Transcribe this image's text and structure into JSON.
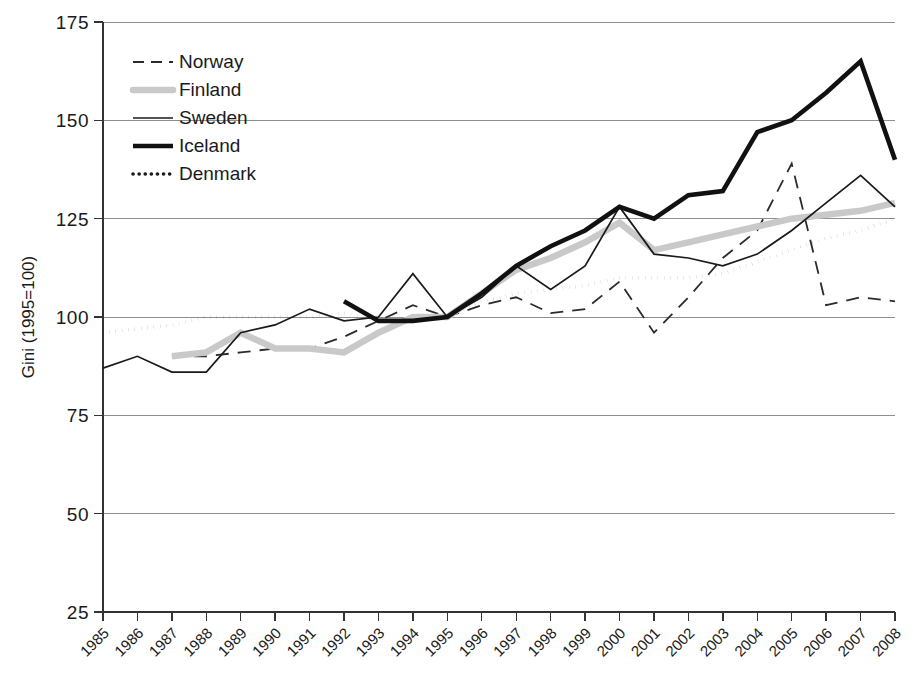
{
  "chart_data": {
    "type": "line",
    "title": "",
    "xlabel": "",
    "ylabel": "Gini (1995=100)",
    "ylim": [
      25,
      175
    ],
    "yticks": [
      25,
      50,
      75,
      100,
      125,
      150,
      175
    ],
    "grid": true,
    "legend_position": "top-left",
    "x": [
      1985,
      1986,
      1987,
      1988,
      1989,
      1990,
      1991,
      1992,
      1993,
      1994,
      1995,
      1996,
      1997,
      1998,
      1999,
      2000,
      2001,
      2002,
      2003,
      2004,
      2005,
      2006,
      2007,
      2008
    ],
    "categories": [
      "1985",
      "1986",
      "1987",
      "1988",
      "1989",
      "1990",
      "1991",
      "1992",
      "1993",
      "1994",
      "1995",
      "1996",
      "1997",
      "1998",
      "1999",
      "2000",
      "2001",
      "2002",
      "2003",
      "2004",
      "2005",
      "2006",
      "2007",
      "2008"
    ],
    "series": [
      {
        "name": "Norway",
        "style": "dashed",
        "color": "#2b2b2b",
        "width": 1.8,
        "values": [
          null,
          null,
          90,
          90,
          91,
          92,
          92,
          95,
          99,
          103,
          100,
          103,
          105,
          101,
          102,
          109,
          96,
          105,
          115,
          122,
          139,
          103,
          105,
          104
        ]
      },
      {
        "name": "Finland",
        "style": "thick-light",
        "color": "#c9c9c9",
        "width": 6.5,
        "values": [
          null,
          null,
          90,
          91,
          96,
          92,
          92,
          91,
          96,
          100,
          100,
          106,
          112,
          115,
          119,
          124,
          117,
          119,
          121,
          123,
          125,
          126,
          127,
          129
        ]
      },
      {
        "name": "Sweden",
        "style": "solid-thin",
        "color": "#1a1a1a",
        "width": 1.7,
        "values": [
          87,
          90,
          86,
          86,
          96,
          98,
          102,
          99,
          100,
          111,
          100,
          105,
          113,
          107,
          113,
          128,
          116,
          115,
          113,
          116,
          122,
          129,
          136,
          128
        ]
      },
      {
        "name": "Iceland",
        "style": "solid-thick",
        "color": "#111111",
        "width": 4.6,
        "values": [
          null,
          null,
          null,
          null,
          null,
          null,
          null,
          104,
          99,
          99,
          100,
          106,
          113,
          118,
          122,
          128,
          125,
          131,
          132,
          147,
          150,
          157,
          165,
          140
        ]
      },
      {
        "name": "Denmark",
        "style": "dotted",
        "color": "#1a1a1a",
        "width": 3.6,
        "values": [
          96,
          97,
          98,
          100,
          100,
          100,
          100,
          101,
          99,
          99,
          100,
          104,
          106,
          107,
          108,
          110,
          110,
          110,
          111,
          114,
          117,
          120,
          122,
          125
        ]
      }
    ]
  },
  "legend": {
    "items": [
      {
        "label": "Norway"
      },
      {
        "label": "Finland"
      },
      {
        "label": "Sweden"
      },
      {
        "label": "Iceland"
      },
      {
        "label": "Denmark"
      }
    ]
  },
  "axes": {
    "y_title": "Gini (1995=100)",
    "y_tick_labels": [
      "175",
      "150",
      "125",
      "100",
      "75",
      "50",
      "25"
    ],
    "x_tick_labels": [
      "1985",
      "1986",
      "1987",
      "1988",
      "1989",
      "1990",
      "1991",
      "1992",
      "1993",
      "1994",
      "1995",
      "1996",
      "1997",
      "1998",
      "1999",
      "2000",
      "2001",
      "2002",
      "2003",
      "2004",
      "2005",
      "2006",
      "2007",
      "2008"
    ]
  }
}
